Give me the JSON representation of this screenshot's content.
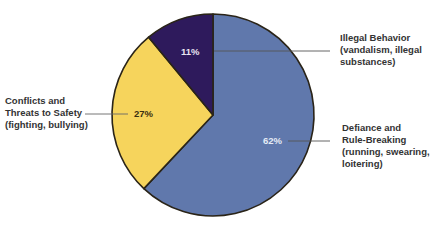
{
  "chart_data": {
    "type": "pie",
    "title": "",
    "categories": [
      "Defiance and Rule-Breaking (running, swearing, loitering)",
      "Conflicts and Threats to Safety (fighting, bullying)",
      "Illegal Behavior (vandalism, illegal substances)"
    ],
    "values": [
      62,
      27,
      11
    ],
    "unit": "%",
    "colors": [
      "#6078AC",
      "#F6D45C",
      "#2E1A5C"
    ],
    "start_angle_deg": 0,
    "direction": "clockwise",
    "legend": "none (callout labels with leader lines)",
    "slices": [
      {
        "key": "defiance",
        "value": 62,
        "pct_label": "62%",
        "label_lines": [
          "Defiance and",
          "Rule-Breaking",
          "(running, swearing,",
          "loitering)"
        ],
        "color": "#6078AC"
      },
      {
        "key": "conflicts",
        "value": 27,
        "pct_label": "27%",
        "label_lines": [
          "Conflicts and",
          "Threats to Safety",
          "(fighting, bullying)"
        ],
        "color": "#F6D45C"
      },
      {
        "key": "illegal",
        "value": 11,
        "pct_label": "11%",
        "label_lines": [
          "Illegal Behavior",
          "(vandalism, illegal",
          "substances)"
        ],
        "color": "#2E1A5C"
      }
    ]
  }
}
